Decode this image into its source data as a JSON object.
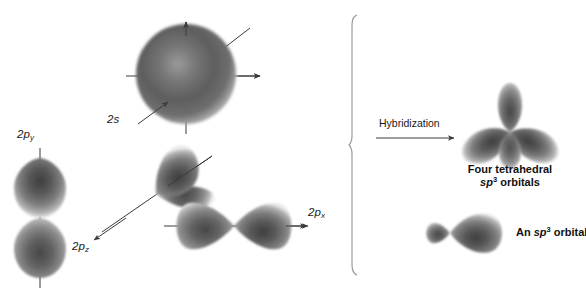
{
  "figure": {
    "background": "#ffffff",
    "width": 586,
    "height": 288,
    "orbital_color_dark": "#4a4a4a",
    "orbital_color_mid": "#8f8f8f",
    "orbital_color_light": "#d8d8d8",
    "line_color": "#3a3a3a"
  },
  "left_panel": {
    "caption": "Atomic orbitals before hybridization",
    "orbitals": [
      {
        "id": "2s",
        "label_main": "2",
        "label_italic": "s",
        "label_sub": "",
        "shape": "sphere",
        "description": "2s spherical orbital with three axis arrows"
      },
      {
        "id": "2py",
        "label_main": "2",
        "label_italic": "p",
        "label_sub": "y",
        "shape": "dumbbell-vertical",
        "description": "2p subscript y orbital oriented vertically"
      },
      {
        "id": "2pz",
        "label_main": "2",
        "label_italic": "p",
        "label_sub": "z",
        "shape": "dumbbell-diagonal",
        "description": "2p subscript z orbital oriented diagonally"
      },
      {
        "id": "2px",
        "label_main": "2",
        "label_italic": "p",
        "label_sub": "x",
        "shape": "dumbbell-horizontal",
        "description": "2p subscript x orbital oriented horizontally"
      }
    ]
  },
  "transition": {
    "label": "Hybridization",
    "arrow": "right-arrow"
  },
  "right_panel": {
    "tetrahedral": {
      "line1": "Four tetrahedral",
      "line2_italic": "sp",
      "line2_sup": "3",
      "line2_rest": " orbitals",
      "shape": "four-lobe-tetrahedral",
      "description": "Four tetrahedral sp3 hybrid orbitals radiating from a center"
    },
    "single": {
      "prefix": "An ",
      "italic": "sp",
      "sup": "3",
      "rest": " orbital",
      "shape": "sp3-single-lobe",
      "description": "A single sp3 hybrid orbital with a small back lobe and large front lobe"
    }
  }
}
